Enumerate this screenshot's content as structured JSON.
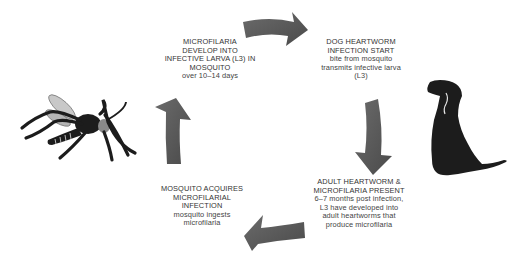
{
  "diagram": {
    "colors": {
      "arrow": "#555555",
      "arrow_light": "#6a6a6a",
      "silhouette": "#1c1c1c",
      "text": "#333333",
      "background": "#ffffff"
    },
    "stages": [
      {
        "id": "microfilaria-develop",
        "heading_lines": [
          "MICROFILARIA",
          "DEVELOP INTO",
          "INFECTIVE LARVA (L3) IN",
          "MOSQUITO"
        ],
        "body_lines": [
          "over 10–14 days"
        ]
      },
      {
        "id": "infection-start",
        "heading_lines": [
          "DOG HEARTWORM",
          "INFECTION START"
        ],
        "body_lines": [
          "bite from mosquito",
          "transmits infective larva",
          "(L3)"
        ]
      },
      {
        "id": "adult-heartworm",
        "heading_lines": [
          "ADULT HEARTWORM &",
          "MICROFILARIA PRESENT"
        ],
        "body_lines": [
          "6–7 months post infection,",
          "L3 have developed into",
          "adult heartworms that",
          "produce microfilaria"
        ]
      },
      {
        "id": "mosquito-acquires",
        "heading_lines": [
          "MOSQUITO ACQUIRES",
          "MICROFILARIAL",
          "INFECTION"
        ],
        "body_lines": [
          "mosquito ingests",
          "microfilaria"
        ]
      }
    ],
    "icons": {
      "mosquito": "mosquito-icon",
      "dog": "dog-icon",
      "arrows": [
        "arrow-right-icon",
        "arrow-down-icon",
        "arrow-left-icon",
        "arrow-up-icon"
      ]
    }
  }
}
